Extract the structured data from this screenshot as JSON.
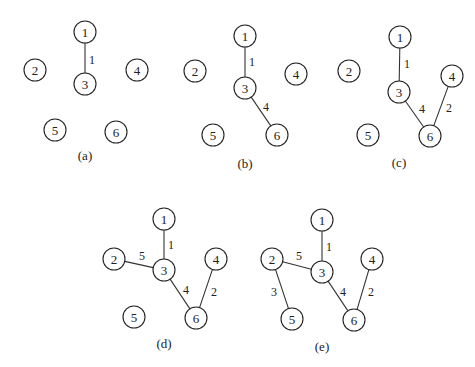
{
  "panels": [
    {
      "label": "(a)",
      "label_pos": [
        85,
        155
      ],
      "nodes": [
        {
          "id": "1",
          "x": 85,
          "y": 32
        },
        {
          "id": "2",
          "x": 35,
          "y": 70
        },
        {
          "id": "3",
          "x": 85,
          "y": 84
        },
        {
          "id": "4",
          "x": 137,
          "y": 70
        },
        {
          "id": "5",
          "x": 55,
          "y": 130
        },
        {
          "id": "6",
          "x": 116,
          "y": 132
        }
      ],
      "edges": [
        {
          "from": "1",
          "to": "3",
          "weight": "1",
          "lx": 92,
          "ly": 60
        }
      ]
    },
    {
      "label": "(b)",
      "label_pos": [
        245,
        163
      ],
      "nodes": [
        {
          "id": "1",
          "x": 245,
          "y": 36
        },
        {
          "id": "2",
          "x": 195,
          "y": 71
        },
        {
          "id": "3",
          "x": 245,
          "y": 88
        },
        {
          "id": "4",
          "x": 296,
          "y": 74
        },
        {
          "id": "5",
          "x": 213,
          "y": 135
        },
        {
          "id": "6",
          "x": 277,
          "y": 135
        }
      ],
      "edges": [
        {
          "from": "1",
          "to": "3",
          "weight": "1",
          "lx": 252,
          "ly": 62
        },
        {
          "from": "3",
          "to": "6",
          "weight": "4",
          "lx": 266,
          "ly": 107
        }
      ]
    },
    {
      "label": "(c)",
      "label_pos": [
        399,
        162
      ],
      "nodes": [
        {
          "id": "1",
          "x": 400,
          "y": 37
        },
        {
          "id": "2",
          "x": 349,
          "y": 71
        },
        {
          "id": "3",
          "x": 399,
          "y": 92
        },
        {
          "id": "4",
          "x": 452,
          "y": 76
        },
        {
          "id": "5",
          "x": 368,
          "y": 135
        },
        {
          "id": "6",
          "x": 430,
          "y": 136
        }
      ],
      "edges": [
        {
          "from": "1",
          "to": "3",
          "weight": "1",
          "lx": 407,
          "ly": 64
        },
        {
          "from": "3",
          "to": "6",
          "weight": "4",
          "lx": 422,
          "ly": 109
        },
        {
          "from": "4",
          "to": "6",
          "weight": "2",
          "lx": 449,
          "ly": 108
        }
      ]
    },
    {
      "label": "(d)",
      "label_pos": [
        164,
        343
      ],
      "nodes": [
        {
          "id": "1",
          "x": 164,
          "y": 219
        },
        {
          "id": "2",
          "x": 114,
          "y": 259
        },
        {
          "id": "3",
          "x": 164,
          "y": 270
        },
        {
          "id": "4",
          "x": 216,
          "y": 259
        },
        {
          "id": "5",
          "x": 134,
          "y": 317
        },
        {
          "id": "6",
          "x": 196,
          "y": 318
        }
      ],
      "edges": [
        {
          "from": "1",
          "to": "3",
          "weight": "1",
          "lx": 171,
          "ly": 245
        },
        {
          "from": "2",
          "to": "3",
          "weight": "5",
          "lx": 142,
          "ly": 256
        },
        {
          "from": "3",
          "to": "6",
          "weight": "4",
          "lx": 186,
          "ly": 290
        },
        {
          "from": "4",
          "to": "6",
          "weight": "2",
          "lx": 214,
          "ly": 292
        }
      ]
    },
    {
      "label": "(e)",
      "label_pos": [
        322,
        346
      ],
      "nodes": [
        {
          "id": "1",
          "x": 322,
          "y": 220
        },
        {
          "id": "2",
          "x": 272,
          "y": 259
        },
        {
          "id": "3",
          "x": 322,
          "y": 272
        },
        {
          "id": "4",
          "x": 372,
          "y": 259
        },
        {
          "id": "5",
          "x": 292,
          "y": 319
        },
        {
          "id": "6",
          "x": 354,
          "y": 320
        }
      ],
      "edges": [
        {
          "from": "1",
          "to": "3",
          "weight": "1",
          "lx": 329,
          "ly": 247
        },
        {
          "from": "2",
          "to": "3",
          "weight": "5",
          "lx": 299,
          "ly": 256
        },
        {
          "from": "2",
          "to": "5",
          "weight": "3",
          "lx": 274,
          "ly": 292
        },
        {
          "from": "3",
          "to": "6",
          "weight": "4",
          "lx": 343,
          "ly": 292
        },
        {
          "from": "4",
          "to": "6",
          "weight": "2",
          "lx": 371,
          "ly": 292
        }
      ]
    }
  ],
  "style": {
    "node_radius": 11,
    "stroke_color": "#222222",
    "background": "#ffffff"
  }
}
